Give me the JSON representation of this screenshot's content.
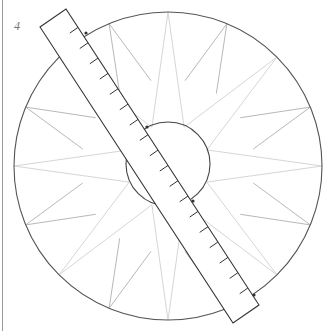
{
  "figure": {
    "label": "4"
  },
  "geometry": {
    "canvas": {
      "width": 329,
      "height": 331
    },
    "outer_circle": {
      "cx": 168,
      "cy": 166,
      "r": 154,
      "stroke": "#555555"
    },
    "inner_circle": {
      "cx": 168,
      "cy": 164,
      "r": 42,
      "stroke": "#444444"
    },
    "star": {
      "long_points": {
        "count": 8,
        "start_angle_deg": 0,
        "step_deg": 45,
        "inner_radius": 42,
        "half_spread_deg": 22.5,
        "stroke": "#d6d6d6"
      },
      "short_points": {
        "count": 8,
        "start_angle_deg": 22.5,
        "step_deg": 45,
        "inner_radius": 87,
        "half_spread_deg": 11.25,
        "stroke": "#b8b8b8"
      }
    },
    "ruler": {
      "corners": [
        [
          40,
          27
        ],
        [
          66,
          9
        ],
        [
          259,
          305
        ],
        [
          233,
          323
        ]
      ],
      "stroke": "#333333",
      "tick_count": 18,
      "tick_start": 22,
      "tick_spacing": 18.3,
      "tick_length": 10
    },
    "markers": [
      [
        86,
        33
      ],
      [
        147,
        127
      ],
      [
        193,
        201
      ],
      [
        254,
        295
      ]
    ]
  },
  "colors": {
    "background": "#ffffff",
    "left_rule": "#9a9a9a",
    "label": "#777777"
  }
}
